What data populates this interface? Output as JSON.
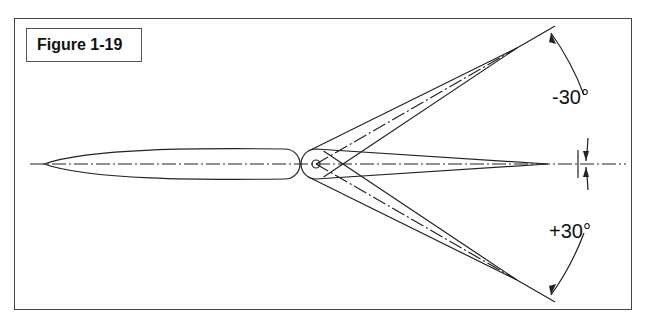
{
  "figure": {
    "label": "Figure 1-19"
  },
  "diagram": {
    "angles": [
      {
        "label": "-30°",
        "direction": "up"
      },
      {
        "label": "+30°",
        "direction": "down"
      }
    ],
    "colors": {
      "line": "#222222",
      "frame": "#444444"
    }
  }
}
